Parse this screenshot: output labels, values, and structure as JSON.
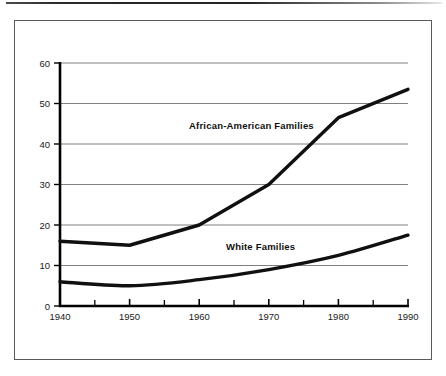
{
  "figure": {
    "background_color": "#ffffff",
    "frame_color": "#5a5a5a",
    "line_color": "#101010",
    "gridline_color": "#808080",
    "axis_color": "#000000"
  },
  "chart_data": {
    "type": "line",
    "title": "",
    "subtitle": "",
    "xlabel": "",
    "ylabel": "",
    "x": [
      1940,
      1950,
      1960,
      1970,
      1980,
      1990
    ],
    "xlim": [
      1940,
      1990
    ],
    "ylim": [
      0,
      60
    ],
    "xticks": [
      1940,
      1950,
      1960,
      1970,
      1980,
      1990
    ],
    "xtick_labels": [
      "1940",
      "1950",
      "1960",
      "1970",
      "1980",
      "1990"
    ],
    "minor_xticks": [
      1945,
      1955,
      1965,
      1975,
      1985
    ],
    "yticks": [
      0,
      10,
      20,
      30,
      40,
      50,
      60
    ],
    "ytick_labels": [
      "0",
      "10",
      "20",
      "30",
      "40",
      "50",
      "60"
    ],
    "grid": true,
    "grid_axis": "y",
    "legend": "inline-annotations",
    "legend_position": "inline",
    "series": [
      {
        "name": "African-American Families",
        "values": [
          16,
          15,
          20,
          30,
          46.5,
          53.5
        ],
        "annotation": "African-American Families",
        "annotation_x": 1965,
        "annotation_y": 43.5
      },
      {
        "name": "White Families",
        "values": [
          6,
          5,
          6.5,
          9,
          12.5,
          17.5
        ],
        "annotation": "White Families",
        "annotation_x": 1967.5,
        "annotation_y": 15.5
      }
    ],
    "annotations": [
      {
        "text": "African-American Families",
        "x": 1965,
        "y": 43.5
      },
      {
        "text": "White Families",
        "x": 1967.5,
        "y": 15.5
      }
    ]
  }
}
